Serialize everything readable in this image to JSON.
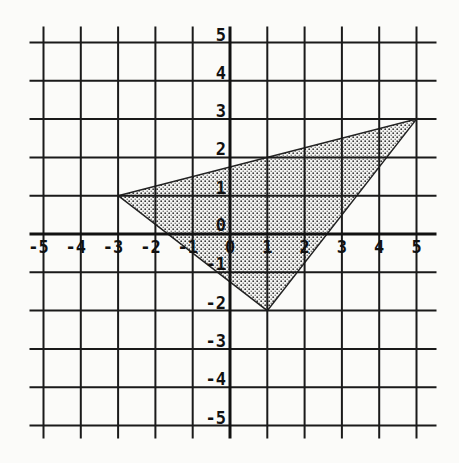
{
  "chart_data": {
    "type": "scatter",
    "title": "",
    "xlabel": "",
    "ylabel": "",
    "xlim": [
      -5,
      5
    ],
    "ylim": [
      -5,
      5
    ],
    "grid": true,
    "x_ticks": [
      "-5",
      "-4",
      "-3",
      "-2",
      "-1",
      "0",
      "1",
      "2",
      "3",
      "4",
      "5"
    ],
    "y_ticks": [
      "5",
      "4",
      "3",
      "2",
      "1",
      "0",
      "-1",
      "-2",
      "-3",
      "-4",
      "-5"
    ],
    "shape": {
      "name": "shaded-triangle",
      "vertices": [
        [
          -3,
          1
        ],
        [
          5,
          3
        ],
        [
          1,
          -2
        ]
      ],
      "fill": "dotted",
      "fill_color": "#888888"
    },
    "colors": {
      "grid": "#1a1a1a",
      "background": "#fbfbf9"
    }
  }
}
